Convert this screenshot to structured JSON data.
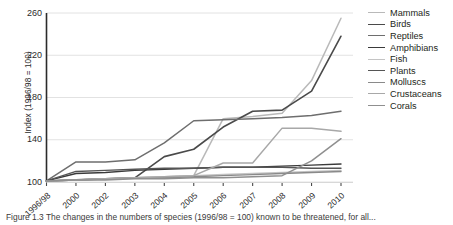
{
  "chart_data": {
    "type": "line",
    "title": "",
    "xlabel": "",
    "ylabel": "Index (1996/98 = 100)",
    "x": [
      "1996/98",
      "2000",
      "2002",
      "2003",
      "2004",
      "2005",
      "2006",
      "2007",
      "2008",
      "2009",
      "2010"
    ],
    "categories": [
      "1996/98",
      "2000",
      "2002",
      "2003",
      "2004",
      "2005",
      "2006",
      "2007",
      "2008",
      "2009",
      "2010"
    ],
    "ylim": [
      100,
      260
    ],
    "yticks": [
      100,
      140,
      180,
      220,
      260
    ],
    "grid": true,
    "legend_position": "right",
    "series": [
      {
        "name": "Mammals",
        "color": "#b9b9b9",
        "width": 1.5,
        "values": [
          101,
          102,
          103,
          104,
          105,
          106,
          160,
          162,
          165,
          196,
          255
        ]
      },
      {
        "name": "Birds",
        "color": "#4a4a4a",
        "width": 1.6,
        "values": [
          101,
          102,
          103,
          104,
          124,
          131,
          152,
          167,
          168,
          186,
          238
        ]
      },
      {
        "name": "Reptiles",
        "color": "#6e6e6e",
        "width": 1.5,
        "values": [
          101,
          119,
          119,
          121,
          137,
          158,
          159,
          160,
          161,
          163,
          167
        ]
      },
      {
        "name": "Amphibians",
        "color": "#3a3a3a",
        "width": 1.4,
        "values": [
          101,
          108,
          109,
          111,
          112,
          113,
          114,
          114,
          115,
          116,
          117
        ]
      },
      {
        "name": "Fish",
        "color": "#c4c4c4",
        "width": 1.5,
        "values": [
          101,
          102,
          103,
          104,
          105,
          106,
          107,
          108,
          109,
          110,
          111
        ]
      },
      {
        "name": "Plants",
        "color": "#555555",
        "width": 1.4,
        "values": [
          101,
          110,
          111,
          112,
          113,
          113,
          114,
          114,
          114,
          113,
          113
        ]
      },
      {
        "name": "Molluscs",
        "color": "#8a8a8a",
        "width": 1.4,
        "values": [
          101,
          102,
          103,
          104,
          104,
          105,
          106,
          107,
          108,
          109,
          110
        ]
      },
      {
        "name": "Crustaceans",
        "color": "#a8a8a8",
        "width": 1.5,
        "values": [
          101,
          102,
          103,
          104,
          105,
          106,
          118,
          118,
          151,
          151,
          148
        ]
      },
      {
        "name": "Corals",
        "color": "#8f8f8f",
        "width": 1.5,
        "values": [
          101,
          102,
          102,
          103,
          103,
          104,
          104,
          105,
          106,
          120,
          141
        ]
      }
    ]
  },
  "axes": {
    "y_title": "Index (1996/98 = 100)",
    "y_tick_labels": [
      "260",
      "220",
      "180",
      "140",
      "100"
    ],
    "x_tick_labels": [
      "1996/98",
      "2000",
      "2002",
      "2003",
      "2004",
      "2005",
      "2006",
      "2007",
      "2008",
      "2009",
      "2010"
    ]
  },
  "legend": {
    "items": [
      {
        "label": "Mammals",
        "color": "#b9b9b9",
        "width": 1.5
      },
      {
        "label": "Birds",
        "color": "#4a4a4a",
        "width": 1.8
      },
      {
        "label": "Reptiles",
        "color": "#6e6e6e",
        "width": 1.6
      },
      {
        "label": "Amphibians",
        "color": "#3a3a3a",
        "width": 1.5
      },
      {
        "label": "Fish",
        "color": "#c4c4c4",
        "width": 1.5
      },
      {
        "label": "Plants",
        "color": "#555555",
        "width": 1.7
      },
      {
        "label": "Molluscs",
        "color": "#8a8a8a",
        "width": 1.5
      },
      {
        "label": "Crustaceans",
        "color": "#a8a8a8",
        "width": 1.4
      },
      {
        "label": "Corals",
        "color": "#8f8f8f",
        "width": 1.6
      }
    ]
  },
  "caption": {
    "text": "Figure 1.3   The changes in the numbers of species (1996/98 = 100) known to be threatened, for all..."
  }
}
